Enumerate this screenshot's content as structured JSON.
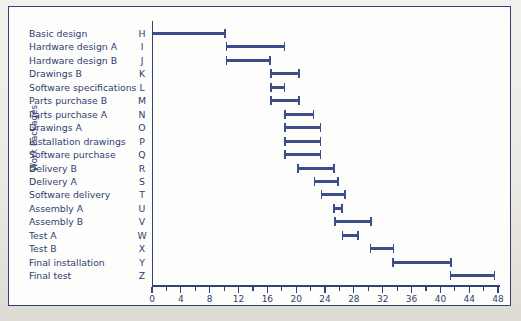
{
  "figure": {
    "y_axis_caption": "Work Packages",
    "accent_color": "#33417a",
    "bar_color": "#3c4d8a"
  },
  "chart_data": {
    "type": "bar",
    "title": "",
    "subtitle": "",
    "xlabel": "",
    "ylabel": "Work Packages",
    "xlim": [
      0,
      48
    ],
    "grid": false,
    "legend": null,
    "orientation": "horizontal",
    "bar_style": "gantt-range",
    "x_major_ticks": [
      0,
      4,
      8,
      12,
      16,
      20,
      24,
      28,
      32,
      36,
      40,
      44,
      48
    ],
    "x_minor_ticks": [
      2,
      6,
      10,
      14,
      18,
      22,
      26,
      30,
      34,
      38,
      42,
      46
    ],
    "x_tick_labels": [
      "0",
      "4",
      "8",
      "12",
      "16",
      "20",
      "24",
      "28",
      "32",
      "36",
      "40",
      "44",
      "48"
    ],
    "categories": [
      "Basic design",
      "Hardware design A",
      "Hardware design B",
      "Drawings B",
      "Software specifications",
      "Parts purchase B",
      "Parts purchase A",
      "Drawings A",
      "Installation drawings",
      "Software purchase",
      "Delivery B",
      "Delivery A",
      "Software delivery",
      "Assembly A",
      "Assembly B",
      "Test A",
      "Test B",
      "Final installation",
      "Final test"
    ],
    "codes": [
      "H",
      "I",
      "J",
      "K",
      "L",
      "M",
      "N",
      "O",
      "P",
      "Q",
      "R",
      "S",
      "T",
      "U",
      "V",
      "W",
      "X",
      "Y",
      "Z"
    ],
    "tasks": [
      {
        "code": "H",
        "label": "Basic design",
        "start": 0,
        "end": 10.2
      },
      {
        "code": "I",
        "label": "Hardware design A",
        "start": 10.2,
        "end": 18.5
      },
      {
        "code": "J",
        "label": "Hardware design B",
        "start": 10.2,
        "end": 16.5
      },
      {
        "code": "K",
        "label": "Drawings B",
        "start": 16.4,
        "end": 20.5
      },
      {
        "code": "L",
        "label": "Software specifications",
        "start": 16.4,
        "end": 18.5
      },
      {
        "code": "M",
        "label": "Parts purchase B",
        "start": 16.4,
        "end": 20.5
      },
      {
        "code": "N",
        "label": "Parts purchase A",
        "start": 18.3,
        "end": 22.5
      },
      {
        "code": "O",
        "label": "Drawings A",
        "start": 18.3,
        "end": 23.5
      },
      {
        "code": "P",
        "label": "Installation drawings",
        "start": 18.3,
        "end": 23.5
      },
      {
        "code": "Q",
        "label": "Software purchase",
        "start": 18.3,
        "end": 23.5
      },
      {
        "code": "R",
        "label": "Delivery B",
        "start": 20.1,
        "end": 25.4
      },
      {
        "code": "S",
        "label": "Delivery A",
        "start": 22.4,
        "end": 25.9
      },
      {
        "code": "T",
        "label": "Software delivery",
        "start": 23.4,
        "end": 26.9
      },
      {
        "code": "U",
        "label": "Assembly A",
        "start": 25.1,
        "end": 26.5
      },
      {
        "code": "V",
        "label": "Assembly B",
        "start": 25.3,
        "end": 30.5
      },
      {
        "code": "W",
        "label": "Test A",
        "start": 26.3,
        "end": 28.7
      },
      {
        "code": "X",
        "label": "Test B",
        "start": 30.2,
        "end": 33.6
      },
      {
        "code": "Y",
        "label": "Final installation",
        "start": 33.3,
        "end": 41.6
      },
      {
        "code": "Z",
        "label": "Final test",
        "start": 41.3,
        "end": 47.6
      }
    ]
  }
}
